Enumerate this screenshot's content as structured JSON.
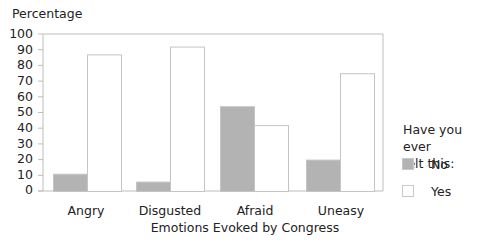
{
  "chart_data": {
    "type": "bar",
    "title": "",
    "ylabel": "Percentage",
    "xlabel": "Emotions Evoked by Congress",
    "categories": [
      "Angry",
      "Disgusted",
      "Afraid",
      "Uneasy"
    ],
    "series": [
      {
        "name": "No",
        "color": "#b3b3b3",
        "values": [
          11,
          6,
          54,
          20
        ]
      },
      {
        "name": "Yes",
        "color": "#ffffff",
        "values": [
          87,
          92,
          42,
          75
        ]
      }
    ],
    "ylim": [
      0,
      100
    ],
    "yticks": [
      "0",
      "10",
      "20",
      "30",
      "40",
      "50",
      "60",
      "70",
      "80",
      "90",
      "100"
    ],
    "grid": false,
    "legend": {
      "title": "Have you ever felt this:",
      "position": "right",
      "entries": [
        "No",
        "Yes"
      ]
    }
  },
  "labels": {
    "ylabel": "Percentage",
    "xlabel": "Emotions Evoked by Congress",
    "categories": [
      "Angry",
      "Disgusted",
      "Afraid",
      "Uneasy"
    ],
    "yticks": [
      "100",
      "90",
      "80",
      "70",
      "60",
      "50",
      "40",
      "30",
      "20",
      "10",
      "0"
    ],
    "legend_title_line1": "Have you ever",
    "legend_title_line2": "felt this:",
    "legend_no": "No",
    "legend_yes": "Yes"
  },
  "colors": {
    "no_fill": "#b3b3b3",
    "yes_fill": "#ffffff",
    "axis": "#bdbdbd",
    "bar_stroke": "#c4c4c4"
  }
}
